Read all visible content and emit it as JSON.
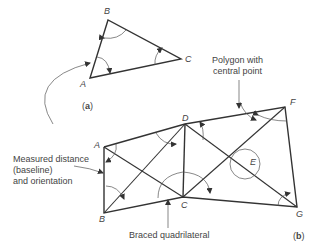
{
  "figure_a": {
    "label_open": "(",
    "label_letter": "a",
    "label_close": ")",
    "points": {
      "A": "A",
      "B": "B",
      "C": "C"
    }
  },
  "figure_b": {
    "label_open": "(",
    "label_letter": "b",
    "label_close": ")",
    "points": {
      "A": "A",
      "B": "B",
      "C": "C",
      "D": "D",
      "E": "E",
      "F": "F",
      "G": "G"
    }
  },
  "annotations": {
    "polygon_line1": "Polygon with",
    "polygon_line2": "central point",
    "baseline_line1": "Measured distance",
    "baseline_line2": "(baseline)",
    "baseline_line3": "and orientation",
    "braced": "Braced quadrilateral"
  },
  "colors": {
    "line": "#333333",
    "text": "#444444",
    "background": "#ffffff"
  }
}
